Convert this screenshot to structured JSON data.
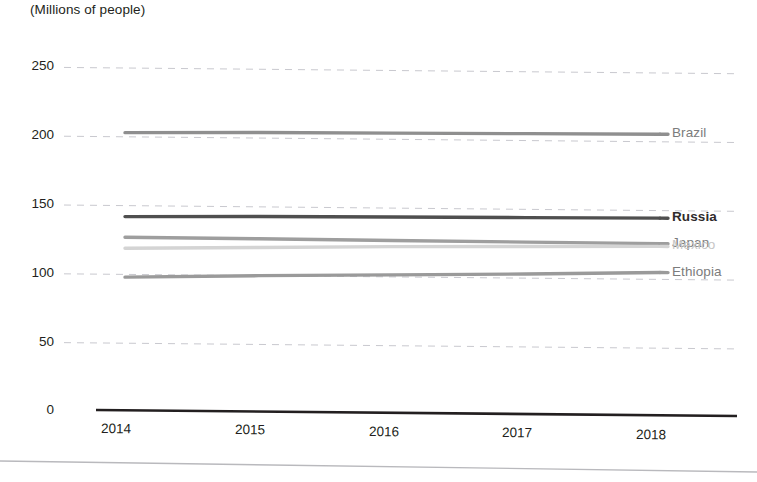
{
  "chart_data": {
    "type": "line",
    "title": "",
    "subtitle": "",
    "axis_note": "(Millions of people)",
    "xlabel": "",
    "ylabel": "",
    "unit": "Millions of people",
    "categories": [
      "2014",
      "2015",
      "2016",
      "2017",
      "2018"
    ],
    "x": [
      2014,
      2015,
      2016,
      2017,
      2018
    ],
    "xlim": [
      2013.6,
      2018.6
    ],
    "ylim": [
      0,
      250
    ],
    "yticks": [
      "0",
      "50",
      "100",
      "150",
      "200",
      "250"
    ],
    "ytick_values": [
      0,
      50,
      100,
      150,
      200,
      250
    ],
    "grid": "horizontal-dashed",
    "legend": "right-inline-labels",
    "series": [
      {
        "name": "Brazil",
        "color": "#8f8f8f",
        "label_color": "#7c7c7c",
        "values": [
          203,
          204,
          204.5,
          205,
          205.5
        ]
      },
      {
        "name": "Russia",
        "color": "#4f4f4f",
        "label_color": "#2f2b2c",
        "values": [
          142,
          143,
          143.5,
          144,
          144.5
        ]
      },
      {
        "name": "Japan",
        "color": "#9e9e9e",
        "label_color": "#7c7c7c",
        "values": [
          127,
          126.8,
          126.5,
          126.2,
          126
        ]
      },
      {
        "name": "Mexico",
        "color": "#d4d4d4",
        "label_color": "#c6c6c6",
        "values": [
          119,
          120.5,
          122,
          123,
          124
        ]
      },
      {
        "name": "Ethiopia",
        "color": "#9a9a9a",
        "label_color": "#7c7c7c",
        "values": [
          98,
          100,
          101.5,
          103,
          105
        ]
      }
    ]
  },
  "figure": {
    "page_rule": "page-edge-rule"
  }
}
